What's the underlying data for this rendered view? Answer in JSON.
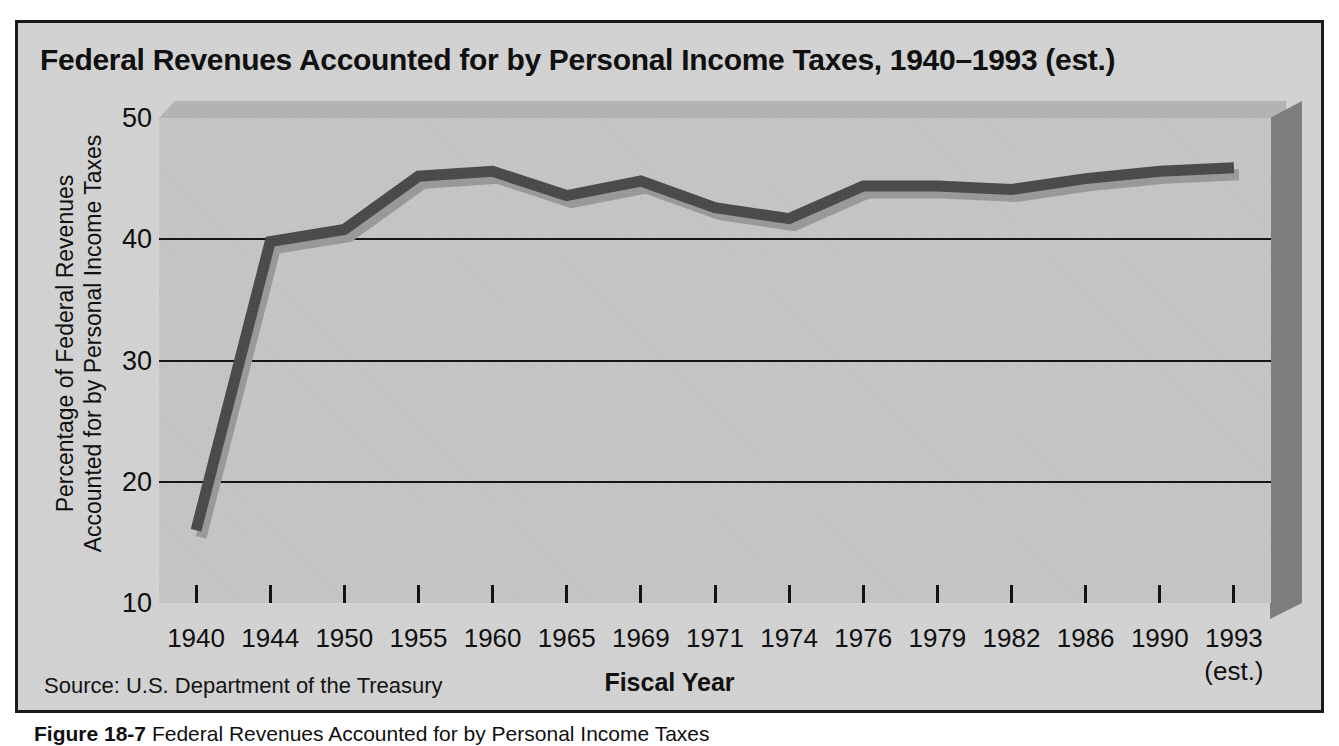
{
  "figure": {
    "title": "Federal Revenues Accounted for by Personal Income Taxes, 1940–1993 (est.)",
    "source_note": "Source: U.S. Department of the Treasury",
    "caption_label": "Figure 18-7",
    "caption_text": "Federal Revenues Accounted for by Personal Income Taxes",
    "background_color": "#d3d3d3",
    "plot_color": "#c6c6c6",
    "line_color": "#4a4a4a",
    "frame_color": "#1a1a1a"
  },
  "chart_data": {
    "type": "line",
    "title": "Federal Revenues Accounted for by Personal Income Taxes, 1940–1993 (est.)",
    "xlabel": "Fiscal Year",
    "ylabel": "Percentage of Federal Revenues Accounted for by Personal Income Taxes",
    "ylabel_line1": "Percentage of Federal Revenues",
    "ylabel_line2": "Accounted for by Personal Income Taxes",
    "categories": [
      "1940",
      "1944",
      "1950",
      "1955",
      "1960",
      "1965",
      "1969",
      "1971",
      "1974",
      "1976",
      "1979",
      "1982",
      "1986",
      "1990",
      "1993"
    ],
    "x_tick_sublabels": [
      "",
      "",
      "",
      "",
      "",
      "",
      "",
      "",
      "",
      "",
      "",
      "",
      "",
      "",
      "(est.)"
    ],
    "values": [
      16.0,
      39.8,
      40.8,
      45.2,
      45.6,
      43.6,
      44.8,
      42.6,
      41.7,
      44.4,
      44.4,
      44.1,
      45.0,
      45.6,
      45.9
    ],
    "ylim": [
      10,
      50
    ],
    "yticks": [
      10,
      20,
      30,
      40,
      50
    ],
    "ytick_labels": [
      "10",
      "20",
      "30",
      "40",
      "50"
    ],
    "gridlines_at": [
      20,
      30,
      40
    ],
    "grid": true,
    "legend": "none",
    "series": [
      {
        "name": "Percentage of federal revenues from personal income taxes",
        "values": [
          16.0,
          39.8,
          40.8,
          45.2,
          45.6,
          43.6,
          44.8,
          42.6,
          41.7,
          44.4,
          44.4,
          44.1,
          45.0,
          45.6,
          45.9
        ]
      }
    ]
  }
}
